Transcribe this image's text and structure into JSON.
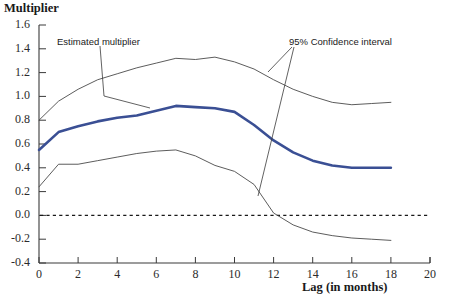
{
  "title": "",
  "axes": {
    "y_title": "Multiplier",
    "x_title": "Lag (in months)",
    "y_ticks": [
      "1.6",
      "1.4",
      "1.2",
      "1.0",
      "0.8",
      "0.6",
      "0.4",
      "0.2",
      "0.0",
      "-0.2",
      "-0.4"
    ],
    "x_ticks": [
      "0",
      "2",
      "4",
      "6",
      "8",
      "10",
      "12",
      "14",
      "16",
      "18",
      "20"
    ]
  },
  "annotations": {
    "estimated": "Estimated multiplier",
    "confidence": "95% Confidence interval"
  },
  "colors": {
    "estimate_line": "#3a4f94",
    "ci_line": "#4a4a4a",
    "zero_line": "#1a1a1a",
    "axis": "#3a3a3a",
    "text": "#1a1a1a"
  },
  "chart_data": {
    "type": "line",
    "title": "",
    "xlabel": "Lag (in months)",
    "ylabel": "Multiplier",
    "xlim": [
      0,
      20
    ],
    "ylim": [
      -0.4,
      1.6
    ],
    "grid": false,
    "legend": "annotations",
    "x": [
      0,
      1,
      2,
      3,
      4,
      5,
      6,
      7,
      8,
      9,
      10,
      11,
      12,
      13,
      14,
      15,
      16,
      17,
      18
    ],
    "series": [
      {
        "name": "Estimated multiplier",
        "color": "#3a4f94",
        "width": 2.6,
        "values": [
          0.55,
          0.7,
          0.75,
          0.79,
          0.82,
          0.84,
          0.88,
          0.92,
          0.91,
          0.9,
          0.87,
          0.76,
          0.63,
          0.53,
          0.46,
          0.42,
          0.4,
          0.4,
          0.4
        ]
      },
      {
        "name": "Upper 95% confidence bound",
        "color": "#4a4a4a",
        "width": 0.9,
        "values": [
          0.8,
          0.96,
          1.06,
          1.14,
          1.19,
          1.24,
          1.28,
          1.32,
          1.31,
          1.33,
          1.29,
          1.23,
          1.14,
          1.06,
          1.0,
          0.95,
          0.93,
          0.94,
          0.95
        ]
      },
      {
        "name": "Lower 95% confidence bound",
        "color": "#4a4a4a",
        "width": 0.9,
        "values": [
          0.24,
          0.43,
          0.43,
          0.46,
          0.49,
          0.52,
          0.54,
          0.55,
          0.5,
          0.42,
          0.37,
          0.26,
          0.02,
          -0.08,
          -0.14,
          -0.17,
          -0.19,
          -0.2,
          -0.21
        ]
      }
    ],
    "zero_reference_line": 0.0,
    "annotations": [
      {
        "text": "Estimated multiplier",
        "x_px": 57,
        "y_px": 36,
        "points_to": "Estimated multiplier"
      },
      {
        "text": "95% Confidence interval",
        "x_px": 289,
        "y_px": 36,
        "points_to": "confidence bounds"
      }
    ]
  }
}
